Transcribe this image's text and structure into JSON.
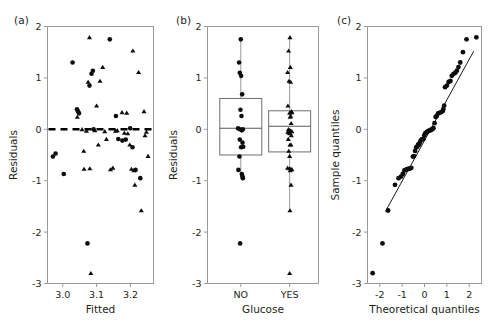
{
  "figure": {
    "panels": [
      {
        "label": "(a)",
        "type": "scatter"
      },
      {
        "label": "(b)",
        "type": "boxplot"
      },
      {
        "label": "(c)",
        "type": "qq"
      }
    ]
  },
  "chart_data": [
    {
      "type": "scatter",
      "panel": "(a)",
      "title": "",
      "xlabel": "Fitted",
      "ylabel": "Residuals",
      "xlim": [
        2.955,
        3.268
      ],
      "ylim": [
        -3,
        2
      ],
      "xticks": [
        3.0,
        3.1,
        3.2
      ],
      "xticklabels": [
        "3.0",
        "3.1",
        "3.2"
      ],
      "yticks": [
        2,
        1,
        0,
        -1,
        -2,
        -3
      ],
      "yticklabels": [
        "2",
        "1",
        "0",
        "-1",
        "-2",
        "-3"
      ],
      "grid": false,
      "legend": "none",
      "reference_line": {
        "orientation": "horizontal",
        "y": 0,
        "style": "dashed"
      },
      "series": [
        {
          "name": "circles",
          "marker": "circle",
          "points": [
            [
              2.971,
              -0.53
            ],
            [
              2.979,
              -0.47
            ],
            [
              3.003,
              -0.87
            ],
            [
              3.029,
              1.3
            ],
            [
              3.042,
              0.39
            ],
            [
              3.045,
              0.35
            ],
            [
              3.048,
              0.31
            ],
            [
              3.079,
              0.85
            ],
            [
              3.085,
              1.08
            ],
            [
              3.089,
              1.14
            ],
            [
              3.091,
              0.0
            ],
            [
              3.073,
              -2.22
            ],
            [
              3.139,
              1.75
            ],
            [
              3.157,
              0.26
            ],
            [
              3.164,
              -0.19
            ],
            [
              3.176,
              -0.22
            ],
            [
              3.186,
              -0.2
            ],
            [
              3.199,
              0.02
            ],
            [
              3.206,
              -0.35
            ],
            [
              3.215,
              -0.79
            ],
            [
              3.229,
              -0.95
            ]
          ]
        },
        {
          "name": "triangles",
          "marker": "triangle",
          "points": [
            [
              3.043,
              0.24
            ],
            [
              3.057,
              0.0
            ],
            [
              3.062,
              -0.42
            ],
            [
              3.063,
              -0.77
            ],
            [
              3.07,
              -0.03
            ],
            [
              3.075,
              0.92
            ],
            [
              3.079,
              1.79
            ],
            [
              3.08,
              -0.76
            ],
            [
              3.083,
              -2.8
            ],
            [
              3.095,
              -0.02
            ],
            [
              3.1,
              0.46
            ],
            [
              3.105,
              -0.3
            ],
            [
              3.11,
              0.94
            ],
            [
              3.118,
              1.21
            ],
            [
              3.124,
              -0.04
            ],
            [
              3.129,
              -0.19
            ],
            [
              3.141,
              -0.78
            ],
            [
              3.148,
              -0.75
            ],
            [
              3.156,
              -0.03
            ],
            [
              3.161,
              -0.02
            ],
            [
              3.175,
              0.33
            ],
            [
              3.182,
              -0.07
            ],
            [
              3.189,
              0.32
            ],
            [
              3.192,
              -0.08
            ],
            [
              3.198,
              -0.3
            ],
            [
              3.203,
              -0.77
            ],
            [
              3.207,
              1.53
            ],
            [
              3.21,
              -0.8
            ],
            [
              3.213,
              -1.08
            ],
            [
              3.224,
              1.11
            ],
            [
              3.232,
              -1.58
            ],
            [
              3.24,
              0.35
            ],
            [
              3.243,
              -0.12
            ],
            [
              3.247,
              -0.05
            ],
            [
              3.252,
              -0.52
            ]
          ]
        }
      ]
    },
    {
      "type": "boxplot",
      "panel": "(b)",
      "title": "",
      "xlabel": "Glucose",
      "ylabel": "Residuals",
      "ylim": [
        -3,
        2
      ],
      "yticks": [
        2,
        1,
        0,
        -1,
        -2,
        -3
      ],
      "yticklabels": [
        "2",
        "1",
        "0",
        "-1",
        "-2",
        "-3"
      ],
      "categories": [
        "NO",
        "YES"
      ],
      "grid": false,
      "legend": "none",
      "boxes": [
        {
          "category": "NO",
          "marker": "circle",
          "q1": -0.5,
          "median": 0.02,
          "q3": 0.6,
          "whisker_low": -0.95,
          "whisker_high": 1.75,
          "points": [
            [
              0.0,
              1.75
            ],
            [
              -0.1,
              1.3
            ],
            [
              -0.06,
              1.1
            ],
            [
              0.02,
              1.04
            ],
            [
              0.08,
              0.68
            ],
            [
              -0.02,
              0.38
            ],
            [
              0.04,
              0.26
            ],
            [
              -0.16,
              0.02
            ],
            [
              -0.07,
              0.0
            ],
            [
              0.06,
              -0.02
            ],
            [
              0.12,
              0.0
            ],
            [
              -0.06,
              -0.2
            ],
            [
              0.1,
              -0.26
            ],
            [
              0.02,
              -0.35
            ],
            [
              0.14,
              -0.34
            ],
            [
              -0.08,
              -0.53
            ],
            [
              -0.14,
              -0.79
            ],
            [
              0.06,
              -0.87
            ],
            [
              0.1,
              -0.92
            ],
            [
              0.12,
              -0.95
            ],
            [
              -0.04,
              -2.22
            ]
          ]
        },
        {
          "category": "YES",
          "marker": "triangle",
          "q1": -0.44,
          "median": 0.06,
          "q3": 0.36,
          "whisker_low": -1.58,
          "whisker_high": 1.79,
          "points": [
            [
              0.02,
              1.79
            ],
            [
              -0.06,
              1.53
            ],
            [
              0.04,
              1.21
            ],
            [
              -0.12,
              1.11
            ],
            [
              -0.04,
              0.94
            ],
            [
              0.06,
              0.92
            ],
            [
              -0.1,
              0.46
            ],
            [
              0.1,
              0.35
            ],
            [
              0.14,
              0.33
            ],
            [
              0.0,
              0.32
            ],
            [
              0.06,
              0.26
            ],
            [
              0.03,
              0.24
            ],
            [
              0.09,
              0.12
            ],
            [
              -0.07,
              0.0
            ],
            [
              0.0,
              -0.02
            ],
            [
              0.07,
              -0.03
            ],
            [
              0.13,
              -0.04
            ],
            [
              -0.11,
              -0.05
            ],
            [
              -0.03,
              -0.07
            ],
            [
              0.04,
              -0.08
            ],
            [
              0.1,
              -0.12
            ],
            [
              -0.08,
              -0.19
            ],
            [
              0.02,
              -0.3
            ],
            [
              0.08,
              -0.3
            ],
            [
              -0.05,
              -0.42
            ],
            [
              0.0,
              -0.52
            ],
            [
              -0.12,
              -0.75
            ],
            [
              0.0,
              -0.76
            ],
            [
              0.08,
              -0.77
            ],
            [
              0.14,
              -0.78
            ],
            [
              0.04,
              -0.8
            ],
            [
              0.08,
              -1.08
            ],
            [
              0.02,
              -1.58
            ],
            [
              0.0,
              -2.8
            ]
          ]
        }
      ]
    },
    {
      "type": "scatter",
      "panel": "(c)",
      "title": "",
      "xlabel": "Theoretical quantiles",
      "ylabel": "Sample quantiles",
      "xlim": [
        -2.55,
        2.55
      ],
      "ylim": [
        -3,
        2
      ],
      "xticks": [
        -2,
        -1,
        0,
        1,
        2
      ],
      "xticklabels": [
        "-2",
        "-1",
        "0",
        "1",
        "2"
      ],
      "yticks": [
        2,
        1,
        0,
        -1,
        -2,
        -3
      ],
      "yticklabels": [
        "2",
        "1",
        "0",
        "-1",
        "-2",
        "-3"
      ],
      "grid": false,
      "legend": "none",
      "reference_line": {
        "orientation": "qq",
        "x0": -1.75,
        "y0": -1.6,
        "x1": 2.2,
        "y1": 1.52
      },
      "series": [
        {
          "name": "sample-quantiles",
          "marker": "circle",
          "points": [
            [
              -2.32,
              -2.8
            ],
            [
              -1.88,
              -2.22
            ],
            [
              -1.63,
              -1.58
            ],
            [
              -1.32,
              -1.08
            ],
            [
              -1.16,
              -0.95
            ],
            [
              -1.05,
              -0.92
            ],
            [
              -0.97,
              -0.87
            ],
            [
              -0.9,
              -0.8
            ],
            [
              -0.84,
              -0.79
            ],
            [
              -0.79,
              -0.78
            ],
            [
              -0.74,
              -0.77
            ],
            [
              -0.69,
              -0.77
            ],
            [
              -0.64,
              -0.76
            ],
            [
              -0.59,
              -0.75
            ],
            [
              -0.52,
              -0.53
            ],
            [
              -0.47,
              -0.52
            ],
            [
              -0.42,
              -0.42
            ],
            [
              -0.37,
              -0.35
            ],
            [
              -0.33,
              -0.34
            ],
            [
              -0.29,
              -0.3
            ],
            [
              -0.25,
              -0.3
            ],
            [
              -0.21,
              -0.26
            ],
            [
              -0.17,
              -0.22
            ],
            [
              -0.13,
              -0.2
            ],
            [
              -0.09,
              -0.19
            ],
            [
              -0.05,
              -0.19
            ],
            [
              -0.01,
              -0.12
            ],
            [
              0.03,
              -0.08
            ],
            [
              0.07,
              -0.07
            ],
            [
              0.11,
              -0.05
            ],
            [
              0.15,
              -0.04
            ],
            [
              0.19,
              -0.03
            ],
            [
              0.23,
              -0.02
            ],
            [
              0.27,
              -0.02
            ],
            [
              0.31,
              0.0
            ],
            [
              0.35,
              0.0
            ],
            [
              0.4,
              0.02
            ],
            [
              0.45,
              0.12
            ],
            [
              0.5,
              0.24
            ],
            [
              0.55,
              0.26
            ],
            [
              0.61,
              0.31
            ],
            [
              0.67,
              0.32
            ],
            [
              0.74,
              0.33
            ],
            [
              0.81,
              0.35
            ],
            [
              0.84,
              0.39
            ],
            [
              0.88,
              0.46
            ],
            [
              0.92,
              0.82
            ],
            [
              1.0,
              0.85
            ],
            [
              1.08,
              0.92
            ],
            [
              1.16,
              0.94
            ],
            [
              1.22,
              1.04
            ],
            [
              1.3,
              1.08
            ],
            [
              1.38,
              1.1
            ],
            [
              1.45,
              1.14
            ],
            [
              1.52,
              1.21
            ],
            [
              1.6,
              1.3
            ],
            [
              1.72,
              1.5
            ],
            [
              1.88,
              1.75
            ],
            [
              2.32,
              1.79
            ]
          ]
        }
      ]
    }
  ]
}
